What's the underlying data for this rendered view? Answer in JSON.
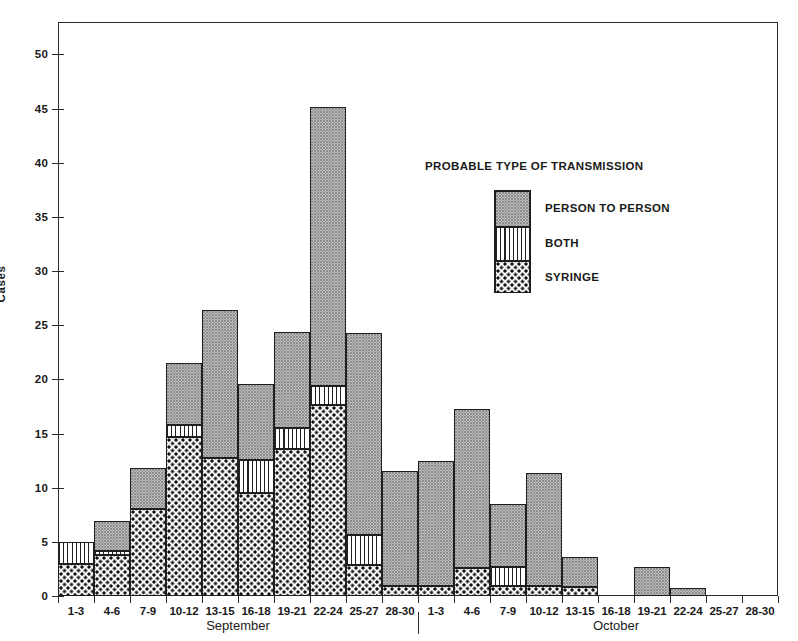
{
  "chart_data": {
    "type": "bar",
    "title": "",
    "xlabel": "",
    "ylabel": "Cases",
    "ylim": [
      0,
      53
    ],
    "yticks": [
      0,
      5,
      10,
      15,
      20,
      25,
      30,
      35,
      40,
      45,
      50
    ],
    "grid": false,
    "stacked": true,
    "legend": {
      "title": "PROBABLE TYPE OF TRANSMISSION",
      "position": "inside-upper-right",
      "entries": [
        "PERSON TO PERSON",
        "BOTH",
        "SYRINGE"
      ]
    },
    "group_axis": [
      {
        "label": "September",
        "start_index": 0,
        "end_index": 9
      },
      {
        "label": "October",
        "start_index": 10,
        "end_index": 20
      }
    ],
    "categories": [
      "1-3",
      "4-6",
      "7-9",
      "10-12",
      "13-15",
      "16-18",
      "19-21",
      "22-24",
      "25-27",
      "28-30",
      "1-3",
      "4-6",
      "7-9",
      "10-12",
      "13-15",
      "16-18",
      "19-21",
      "22-24",
      "25-27",
      "28-30"
    ],
    "series": [
      {
        "name": "SYRINGE",
        "values": [
          3.0,
          3.8,
          8.0,
          14.7,
          12.7,
          9.5,
          13.6,
          17.6,
          2.9,
          0.9,
          0.9,
          2.6,
          0.9,
          0.9,
          0.8,
          0,
          0,
          0,
          0,
          0
        ]
      },
      {
        "name": "BOTH",
        "values": [
          2.0,
          0.4,
          0.0,
          1.1,
          0.0,
          3.1,
          1.9,
          1.8,
          2.7,
          0.0,
          0.0,
          0.0,
          1.8,
          0.0,
          0.0,
          0,
          0,
          0,
          0,
          0
        ]
      },
      {
        "name": "PERSON TO PERSON",
        "values": [
          0.0,
          2.7,
          3.8,
          5.7,
          13.7,
          7.0,
          8.9,
          25.8,
          18.7,
          10.6,
          11.6,
          14.7,
          5.8,
          10.5,
          2.8,
          0,
          2.7,
          0.7,
          0,
          0
        ]
      }
    ],
    "totals": [
      5.0,
      6.9,
      11.8,
      21.5,
      26.4,
      19.6,
      24.4,
      45.2,
      24.3,
      11.5,
      12.5,
      17.3,
      8.5,
      11.4,
      3.6,
      0,
      2.7,
      0.7,
      0,
      0
    ]
  },
  "colors": {
    "axis": "#2b2b2b",
    "person_to_person": "#eeeeee",
    "both": "#ffffff",
    "syringe": "#fbfbfb",
    "ink": "#141414"
  }
}
